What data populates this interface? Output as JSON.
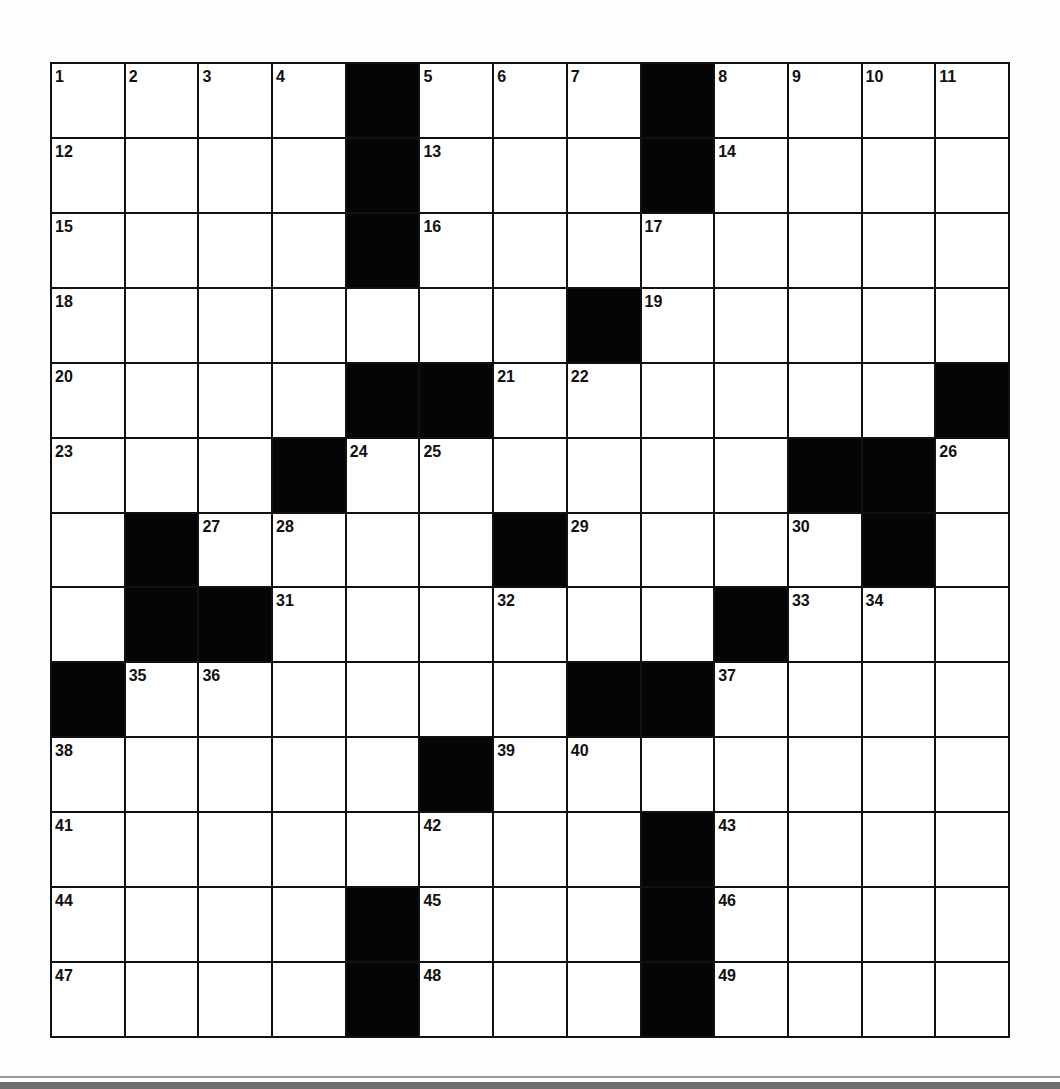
{
  "puzzle": {
    "rows": 13,
    "cols": 13,
    "colors": {
      "block": "#050505",
      "cell": "#ffffff",
      "line": "#111111"
    },
    "layout": [
      "....#...#....",
      "....#...#....",
      "....#........",
      ".......#.....",
      "....##......#",
      "...#......##.",
      ".#....#....#.",
      ".##......#...",
      "#......##....",
      ".....#.......",
      "........#....",
      "....#...#....",
      "....#...#...."
    ],
    "numbers": [
      [
        1,
        2,
        3,
        4,
        0,
        5,
        6,
        7,
        0,
        8,
        9,
        10,
        11
      ],
      [
        12,
        0,
        0,
        0,
        0,
        13,
        0,
        0,
        0,
        14,
        0,
        0,
        0
      ],
      [
        15,
        0,
        0,
        0,
        0,
        16,
        0,
        0,
        17,
        0,
        0,
        0,
        0
      ],
      [
        18,
        0,
        0,
        0,
        0,
        0,
        0,
        0,
        19,
        0,
        0,
        0,
        0
      ],
      [
        20,
        0,
        0,
        0,
        0,
        0,
        21,
        22,
        0,
        0,
        0,
        0,
        0
      ],
      [
        23,
        0,
        0,
        0,
        24,
        25,
        0,
        0,
        0,
        0,
        0,
        0,
        26
      ],
      [
        0,
        0,
        27,
        28,
        0,
        0,
        0,
        29,
        0,
        0,
        30,
        0,
        0
      ],
      [
        0,
        0,
        0,
        31,
        0,
        0,
        32,
        0,
        0,
        0,
        33,
        34,
        0
      ],
      [
        0,
        35,
        36,
        0,
        0,
        0,
        0,
        0,
        0,
        37,
        0,
        0,
        0
      ],
      [
        38,
        0,
        0,
        0,
        0,
        0,
        39,
        40,
        0,
        0,
        0,
        0,
        0
      ],
      [
        41,
        0,
        0,
        0,
        0,
        42,
        0,
        0,
        0,
        43,
        0,
        0,
        0
      ],
      [
        44,
        0,
        0,
        0,
        0,
        45,
        0,
        0,
        0,
        46,
        0,
        0,
        0
      ],
      [
        47,
        0,
        0,
        0,
        0,
        48,
        0,
        0,
        0,
        49,
        0,
        0,
        0
      ]
    ],
    "entries": []
  },
  "clue_numbers": {
    "across": [
      1,
      5,
      8,
      12,
      13,
      14,
      15,
      16,
      18,
      19,
      20,
      21,
      23,
      24,
      27,
      29,
      31,
      33,
      35,
      37,
      38,
      39,
      41,
      43,
      44,
      45,
      46,
      47,
      48,
      49
    ],
    "down": [
      1,
      2,
      3,
      4,
      5,
      6,
      7,
      8,
      9,
      10,
      11,
      17,
      22,
      24,
      25,
      26,
      28,
      30,
      32,
      34,
      35,
      36,
      37,
      38,
      40,
      42
    ]
  }
}
